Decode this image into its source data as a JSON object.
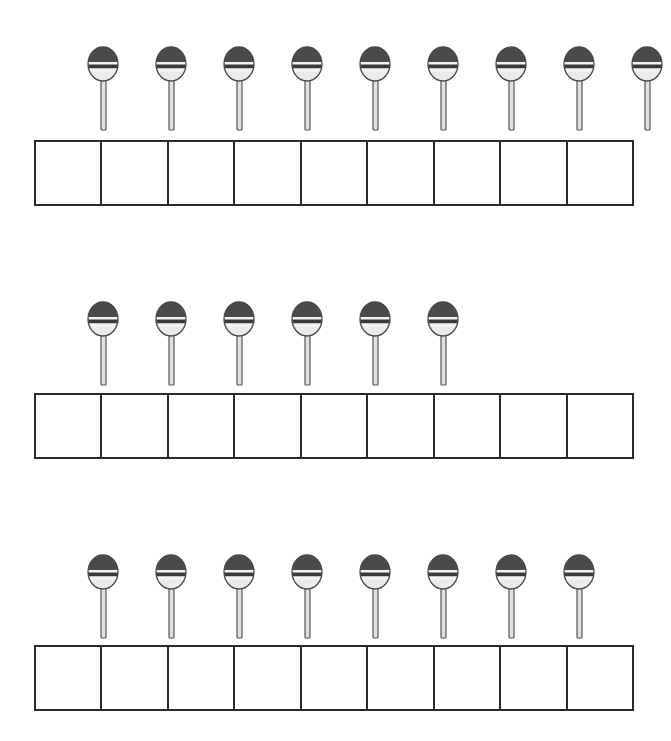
{
  "page": {
    "type": "counting-worksheet",
    "background_color": "#ffffff",
    "width": 671,
    "height": 741
  },
  "colors": {
    "candy_top": "#4a4a4a",
    "candy_stripe_dark": "#3a3a3a",
    "candy_stripe_light": "#f2f2f2",
    "candy_bottom": "#ebebeb",
    "outline": "#4a4a4a",
    "stick_fill": "#e0e0e0",
    "stick_outline": "#555555",
    "grid_border": "#2b2b2b",
    "grid_fill": "#ffffff"
  },
  "icons": {
    "lollipop": "lollipop-icon"
  },
  "grid": {
    "columns": 9,
    "cell_value": ""
  },
  "exercises": [
    {
      "id": "exercise-1",
      "lollipop_count": 9,
      "row_top": 40,
      "grid_top": 140,
      "grid_columns": 9
    },
    {
      "id": "exercise-2",
      "lollipop_count": 6,
      "row_top": 295,
      "grid_top": 393,
      "grid_columns": 9
    },
    {
      "id": "exercise-3",
      "lollipop_count": 8,
      "row_top": 548,
      "grid_top": 645,
      "grid_columns": 9
    }
  ],
  "layout": {
    "lollipop_spacing": 68,
    "lollipop_start_x": 14,
    "grid_left": 34,
    "grid_width": 600,
    "grid_cell_height": 66
  }
}
